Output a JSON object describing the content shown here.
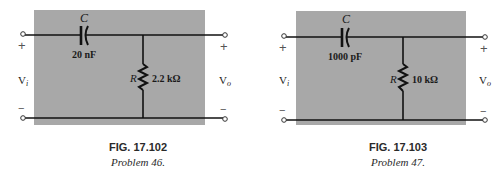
{
  "colors": {
    "panel": "#a8a8a8",
    "wire": "#111111",
    "text": "#1a1a1a",
    "background": "#ffffff"
  },
  "figures": [
    {
      "id": "fig-17-102",
      "caption_number": "FIG. 17.102",
      "caption_problem": "Problem 46.",
      "capacitor_label": "C",
      "capacitor_value": "20 nF",
      "resistor_label": "R",
      "resistor_value": "2.2 kΩ",
      "input_label": "V",
      "input_sub": "i",
      "output_label": "V",
      "output_sub": "o",
      "plus": "+",
      "minus": "−"
    },
    {
      "id": "fig-17-103",
      "caption_number": "FIG. 17.103",
      "caption_problem": "Problem 47.",
      "capacitor_label": "C",
      "capacitor_value": "1000 pF",
      "resistor_label": "R",
      "resistor_value": "10 kΩ",
      "input_label": "V",
      "input_sub": "i",
      "output_label": "V",
      "output_sub": "o",
      "plus": "+",
      "minus": "−"
    }
  ]
}
